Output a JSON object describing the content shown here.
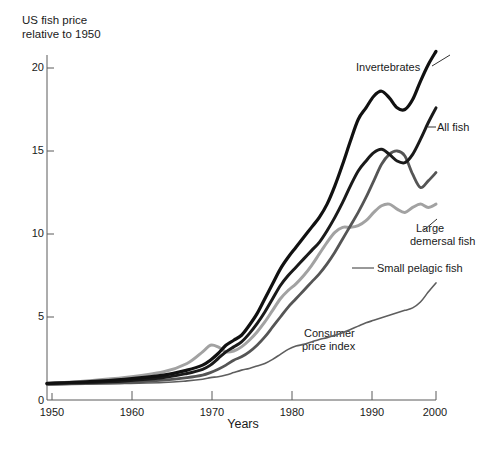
{
  "chart_data": {
    "type": "line",
    "title": "US fish price relative to 1950",
    "xlabel": "Years",
    "ylabel": "US fish price\nrelative to 1950",
    "xlim": [
      1950,
      2000
    ],
    "ylim": [
      0,
      22
    ],
    "xticks": [
      1950,
      1960,
      1970,
      1980,
      1990,
      2000
    ],
    "yticks": [
      0,
      5,
      10,
      15,
      20
    ],
    "grid": false,
    "legend_position": "inline-annotations",
    "x": [
      1950,
      1955,
      1960,
      1965,
      1968,
      1970,
      1971,
      1972,
      1973,
      1974,
      1975,
      1976,
      1977,
      1978,
      1979,
      1980,
      1981,
      1982,
      1983,
      1984,
      1985,
      1986,
      1987,
      1988,
      1989,
      1990,
      1991,
      1992,
      1993,
      1994,
      1995,
      1996,
      1997,
      1998,
      1999,
      2000
    ],
    "series": [
      {
        "name": "Invertebrates",
        "color": "#111111",
        "width": 3.2,
        "values": [
          1.0,
          1.1,
          1.25,
          1.5,
          1.8,
          2.1,
          2.4,
          2.8,
          3.3,
          3.6,
          3.9,
          4.5,
          5.2,
          6.1,
          7.0,
          7.9,
          8.6,
          9.2,
          9.8,
          10.4,
          11.0,
          11.8,
          12.9,
          14.2,
          15.6,
          16.9,
          17.6,
          18.3,
          18.6,
          18.2,
          17.6,
          17.5,
          18.1,
          19.2,
          20.2,
          21.0
        ]
      },
      {
        "name": "All fish",
        "color": "#1a1a1a",
        "width": 3.0,
        "values": [
          1.0,
          1.05,
          1.15,
          1.35,
          1.6,
          1.85,
          2.1,
          2.5,
          2.9,
          3.2,
          3.5,
          4.0,
          4.6,
          5.3,
          6.1,
          6.9,
          7.5,
          8.0,
          8.5,
          9.0,
          9.5,
          10.2,
          11.0,
          11.9,
          12.9,
          13.8,
          14.4,
          14.9,
          15.1,
          14.8,
          14.4,
          14.3,
          14.8,
          15.7,
          16.7,
          17.6
        ]
      },
      {
        "name": "Small pelagic fish",
        "color": "#555555",
        "width": 2.8,
        "values": [
          0.95,
          1.0,
          1.05,
          1.2,
          1.35,
          1.5,
          1.65,
          1.85,
          2.1,
          2.4,
          2.6,
          2.9,
          3.3,
          3.8,
          4.4,
          5.0,
          5.6,
          6.1,
          6.6,
          7.1,
          7.6,
          8.2,
          8.9,
          9.7,
          10.5,
          11.3,
          12.2,
          13.2,
          14.2,
          14.8,
          15.0,
          14.7,
          13.6,
          12.8,
          13.2,
          13.7
        ]
      },
      {
        "name": "Large demersal fish",
        "color": "#a2a2a2",
        "width": 3.0,
        "values": [
          1.0,
          1.15,
          1.35,
          1.7,
          2.2,
          2.9,
          3.3,
          3.2,
          2.9,
          2.95,
          3.2,
          3.6,
          4.1,
          4.7,
          5.4,
          6.1,
          6.6,
          7.0,
          7.5,
          8.1,
          8.8,
          9.5,
          10.1,
          10.4,
          10.4,
          10.5,
          10.8,
          11.3,
          11.7,
          11.8,
          11.5,
          11.3,
          11.6,
          11.8,
          11.6,
          11.8
        ]
      },
      {
        "name": "Consumer price index",
        "color": "#5e5e5e",
        "width": 1.6,
        "values": [
          0.9,
          0.95,
          1.0,
          1.05,
          1.15,
          1.25,
          1.35,
          1.4,
          1.5,
          1.65,
          1.8,
          1.9,
          2.05,
          2.2,
          2.45,
          2.75,
          3.05,
          3.25,
          3.35,
          3.5,
          3.65,
          3.75,
          3.9,
          4.05,
          4.25,
          4.45,
          4.65,
          4.8,
          4.95,
          5.1,
          5.25,
          5.4,
          5.55,
          5.9,
          6.5,
          7.05
        ]
      }
    ],
    "annotations": [
      {
        "name": "Invertebrates",
        "text": "Invertebrates"
      },
      {
        "name": "All fish",
        "text": "All fish"
      },
      {
        "name": "Large demersal fish",
        "text": "Large\ndemersal fish"
      },
      {
        "name": "Small pelagic fish",
        "text": "Small pelagic fish"
      },
      {
        "name": "Consumer price index",
        "text": "Consumer\nprice index"
      }
    ]
  },
  "axes": {
    "y_title": "US fish price\nrelative to 1950",
    "x_title": "Years",
    "y_ticks": [
      "20",
      "15",
      "10",
      "5",
      "0"
    ],
    "x_ticks": [
      "1950",
      "1960",
      "1970",
      "1980",
      "1990",
      "2000"
    ]
  },
  "labels": {
    "invertebrates": "Invertebrates",
    "all_fish": "All fish",
    "large_demersal_line1": "Large",
    "large_demersal_line2": "demersal fish",
    "small_pelagic": "Small pelagic fish",
    "cpi_line1": "Consumer",
    "cpi_line2": "price index"
  },
  "colors": {
    "invertebrates": "#111111",
    "all_fish": "#1a1a1a",
    "small_pelagic": "#555555",
    "large_demersal": "#a2a2a2",
    "cpi": "#5e5e5e",
    "axis": "#5a5a5a",
    "text": "#1a1a1a",
    "background": "#ffffff"
  }
}
